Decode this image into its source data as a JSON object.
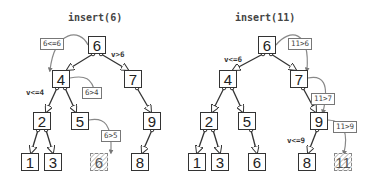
{
  "panels": [
    {
      "title": "insert(6)",
      "nodes": {
        "n6": "6",
        "n4": "4",
        "n7": "7",
        "n2": "2",
        "n5": "5",
        "n9": "9",
        "n1": "1",
        "n3": "3",
        "new": "6",
        "n8": "8"
      },
      "comparisons": [
        "6<=6",
        "6>4",
        "6>5"
      ],
      "conditions": [
        "v>6",
        "v<=4"
      ]
    },
    {
      "title": "insert(11)",
      "nodes": {
        "n6": "6",
        "n4": "4",
        "n7": "7",
        "n2": "2",
        "n5": "5",
        "n9": "9",
        "n1": "1",
        "n3": "3",
        "n6b": "6",
        "n8": "8",
        "new": "11"
      },
      "comparisons": [
        "11>6",
        "11>7",
        "11>9"
      ],
      "conditions": [
        "v<=6",
        "v<=9"
      ]
    }
  ],
  "colors": {
    "edge": "#333333",
    "path": "#888888",
    "new_node_border": "#888888"
  }
}
